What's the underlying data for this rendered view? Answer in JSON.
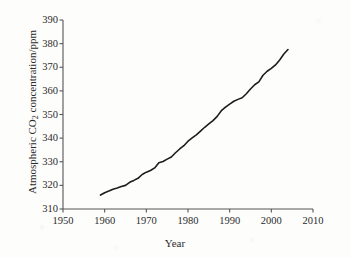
{
  "figure": {
    "background_color": "#fdfdfc",
    "line_color": "#1c1c1c",
    "axis_color": "#555555"
  },
  "axis_titles": {
    "x": "Year",
    "y_prefix": "Atmospheric CO",
    "y_subscript": "2",
    "y_suffix": " concentration/ppm"
  },
  "chart_data": {
    "type": "line",
    "title": "",
    "subtitle": "",
    "xlabel": "Year",
    "ylabel": "Atmospheric CO2 concentration/ppm",
    "xlim": [
      1950,
      2010
    ],
    "ylim": [
      310,
      390
    ],
    "xticks": [
      1950,
      1960,
      1970,
      1980,
      1990,
      2000,
      2010
    ],
    "yticks": [
      310,
      320,
      330,
      340,
      350,
      360,
      370,
      380,
      390
    ],
    "grid": false,
    "legend": false,
    "legend_position": "none",
    "annotations": [],
    "series": [
      {
        "name": "Atmospheric CO2 concentration",
        "color": "#1c1c1c",
        "x": [
          1959,
          1960,
          1961,
          1962,
          1963,
          1964,
          1965,
          1966,
          1967,
          1968,
          1969,
          1970,
          1971,
          1972,
          1973,
          1974,
          1975,
          1976,
          1977,
          1978,
          1979,
          1980,
          1981,
          1982,
          1983,
          1984,
          1985,
          1986,
          1987,
          1988,
          1989,
          1990,
          1991,
          1992,
          1993,
          1994,
          1995,
          1996,
          1997,
          1998,
          1999,
          2000,
          2001,
          2002,
          2003,
          2004
        ],
        "values": [
          315.9,
          316.9,
          317.6,
          318.4,
          318.9,
          319.5,
          320.0,
          321.3,
          322.1,
          323.0,
          324.6,
          325.6,
          326.3,
          327.4,
          329.6,
          330.1,
          331.1,
          332.0,
          333.8,
          335.4,
          336.8,
          338.7,
          340.1,
          341.4,
          343.0,
          344.6,
          346.0,
          347.4,
          349.2,
          351.6,
          353.1,
          354.4,
          355.6,
          356.4,
          357.1,
          358.8,
          360.8,
          362.6,
          363.8,
          366.6,
          368.3,
          369.5,
          371.0,
          373.1,
          375.6,
          377.5
        ]
      }
    ]
  },
  "ytick_labels": [
    "390",
    "380",
    "370",
    "360",
    "350",
    "340",
    "330",
    "320",
    "310"
  ],
  "xtick_labels": [
    "1950",
    "1960",
    "1970",
    "1980",
    "1990",
    "2000",
    "2010"
  ]
}
